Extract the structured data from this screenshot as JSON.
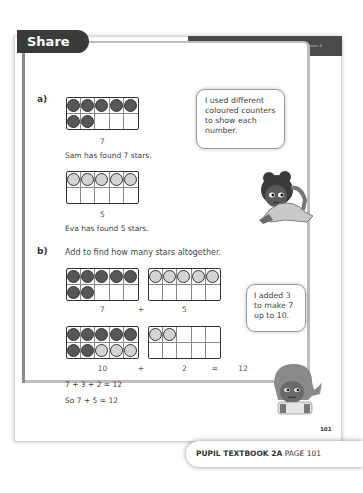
{
  "header": {
    "unit_banner": "Unit 2: Addition and subtraction (1), Lesson 6",
    "section_title": "Share"
  },
  "part_a": {
    "label": "a)",
    "sam": {
      "frame": [
        "dark",
        "dark",
        "dark",
        "dark",
        "dark",
        "dark",
        "dark",
        "empty",
        "empty",
        "empty"
      ],
      "number": "7",
      "caption": "Sam has found 7 stars."
    },
    "eva": {
      "frame": [
        "light",
        "light",
        "light",
        "light",
        "light",
        "empty",
        "empty",
        "empty",
        "empty",
        "empty"
      ],
      "number": "5",
      "caption": "Eva has found 5 stars."
    },
    "speech_bubble": "I used different\ncoloured counters\nto show each\nnumber."
  },
  "part_b": {
    "label": "b)",
    "instruction": "Add to find how many stars altogether.",
    "row1": {
      "frame_left": [
        "dark",
        "dark",
        "dark",
        "dark",
        "dark",
        "dark",
        "dark",
        "empty",
        "empty",
        "empty"
      ],
      "frame_right": [
        "light",
        "light",
        "light",
        "light",
        "light",
        "empty",
        "empty",
        "empty",
        "empty",
        "empty"
      ],
      "left_number": "7",
      "operator": "+",
      "right_number": "5"
    },
    "row2": {
      "frame_left": [
        "dark",
        "dark",
        "dark",
        "dark",
        "dark",
        "dark",
        "dark",
        "light",
        "light",
        "light"
      ],
      "frame_right": [
        "light",
        "light",
        "empty",
        "empty",
        "empty",
        "empty",
        "empty",
        "empty",
        "empty",
        "empty"
      ],
      "left_number": "10",
      "operator": "+",
      "right_number": "2",
      "equals": "=",
      "result": "12"
    },
    "equation1": "7 + 3 + 2 = 12",
    "equation2": "So 7 + 5 = 12",
    "speech_bubble": "I added 3\nto make 7\nup to 10."
  },
  "page_number": "101",
  "footer": {
    "book": "PUPIL TEXTBOOK 2A",
    "page": "PAGE 101"
  },
  "colors": {
    "dark_counter": "#575757",
    "light_counter": "#d4d4d4",
    "banner": "#4a4a4a",
    "tab": "#3a3a3a"
  }
}
